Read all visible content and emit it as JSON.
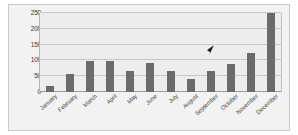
{
  "chart_data": {
    "type": "bar",
    "title": "",
    "subtitle": "",
    "xlabel": "",
    "ylabel": "",
    "categories": [
      "January",
      "February",
      "March",
      "April",
      "May",
      "June",
      "July",
      "August",
      "September",
      "October",
      "November",
      "December"
    ],
    "values": [
      20,
      57,
      97,
      98,
      65,
      92,
      65,
      42,
      68,
      90,
      125,
      250
    ],
    "series": [
      {
        "name": "Monthly value",
        "values": [
          20,
          57,
          97,
          98,
          65,
          92,
          65,
          42,
          68,
          90,
          125,
          250
        ]
      }
    ],
    "ylim": [
      0,
      250
    ],
    "yticks": [
      0,
      50,
      100,
      150,
      200,
      250
    ],
    "ytick_labels": [
      "0",
      "50",
      "100",
      "150",
      "200",
      "250"
    ],
    "grid": true,
    "legend": false,
    "legend_position": "none",
    "bar_color": "#6b6b6b",
    "plot_background": "#ededed",
    "frame_background": "#f2f2f2",
    "gridline_color": "#c7c7c7",
    "axis_color": "#9c9c9c"
  },
  "overlay": {
    "cursor_icon": "mouse-pointer-icon",
    "cursor_color": "#1a1a1a"
  }
}
